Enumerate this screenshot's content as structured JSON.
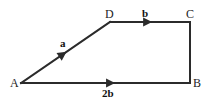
{
  "figure": {
    "background_color": "#ffffff",
    "stroke_color": "#2b2b2b",
    "label_color": "#1c1c1c",
    "width": 208,
    "height": 100
  },
  "vertices": [
    {
      "name": "A",
      "label": "A",
      "x": 21,
      "y": 83,
      "label_x": 10,
      "label_y": 77
    },
    {
      "name": "B",
      "label": "B",
      "x": 190,
      "y": 83,
      "label_x": 193,
      "label_y": 77
    },
    {
      "name": "C",
      "label": "C",
      "x": 190,
      "y": 22,
      "label_x": 186,
      "label_y": 8
    },
    {
      "name": "D",
      "label": "D",
      "x": 110,
      "y": 22,
      "label_x": 105,
      "label_y": 8
    }
  ],
  "edges": [
    {
      "name": "edge-a-d",
      "from": "A",
      "to": "D",
      "arrow": true,
      "arrow_t": 0.47
    },
    {
      "name": "edge-d-c",
      "from": "D",
      "to": "C",
      "arrow": true,
      "arrow_t": 0.47
    },
    {
      "name": "edge-a-b",
      "from": "A",
      "to": "B",
      "arrow": true,
      "arrow_t": 0.53
    },
    {
      "name": "edge-c-b",
      "from": "C",
      "to": "B",
      "arrow": false,
      "arrow_t": 0
    }
  ],
  "vector_labels": [
    {
      "name": "vector-label-a",
      "text": "a",
      "x": 60,
      "y": 38
    },
    {
      "name": "vector-label-b",
      "text": "b",
      "x": 142,
      "y": 8
    },
    {
      "name": "vector-label-2b",
      "text": "2b",
      "x": 102,
      "y": 88
    }
  ]
}
